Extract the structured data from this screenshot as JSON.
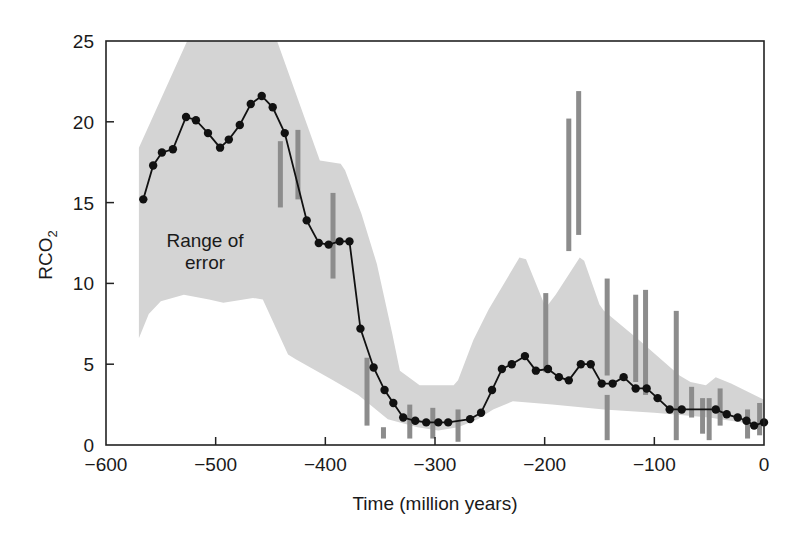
{
  "chart_data": {
    "type": "line",
    "title": "",
    "xlabel": "Time (million years)",
    "ylabel": "RCO2",
    "ylabel_parts": {
      "main": "RCO",
      "sub": "2"
    },
    "xlim": [
      -600,
      0
    ],
    "ylim": [
      0,
      25
    ],
    "x_ticks": [
      -600,
      -500,
      -400,
      -300,
      -200,
      -100,
      0
    ],
    "x_tick_labels": [
      "−600",
      "−500",
      "−400",
      "−300",
      "−200",
      "−100",
      "0"
    ],
    "y_ticks": [
      0,
      5,
      10,
      15,
      20,
      25
    ],
    "y_tick_labels": [
      "0",
      "5",
      "10",
      "15",
      "20",
      "25"
    ],
    "grid": false,
    "legend": null,
    "annotations": [
      {
        "text_lines": [
          "Range of",
          "error"
        ],
        "x": -510,
        "y": 12.8,
        "refers_to": "error_band"
      }
    ],
    "colors": {
      "line": "#111111",
      "marker": "#111111",
      "band": "#d4d4d4",
      "proxy_bars": "#8c8c8c",
      "axis": "#222222"
    },
    "series": [
      {
        "name": "RCO2 model curve",
        "style": "line+markers",
        "x": [
          -566,
          -557,
          -549,
          -539,
          -527,
          -518,
          -507,
          -496,
          -488,
          -478,
          -468,
          -458,
          -448,
          -437,
          -417,
          -406,
          -397,
          -387,
          -378,
          -368,
          -356,
          -346,
          -338,
          -329,
          -318,
          -308,
          -297,
          -288,
          -268,
          -258,
          -248,
          -239,
          -230,
          -218,
          -208,
          -197,
          -187,
          -178,
          -167,
          -158,
          -148,
          -138,
          -128,
          -117,
          -107,
          -97,
          -86,
          -75,
          -44,
          -34,
          -24,
          -16,
          -9,
          0
        ],
        "y": [
          15.2,
          17.3,
          18.1,
          18.3,
          20.3,
          20.1,
          19.3,
          18.4,
          18.9,
          19.8,
          21.1,
          21.6,
          20.9,
          19.3,
          13.9,
          12.5,
          12.4,
          12.6,
          12.6,
          7.2,
          4.8,
          3.4,
          2.6,
          1.7,
          1.5,
          1.4,
          1.4,
          1.4,
          1.6,
          2.0,
          3.4,
          4.7,
          5.0,
          5.5,
          4.6,
          4.7,
          4.2,
          4.0,
          5.0,
          5.0,
          3.8,
          3.8,
          4.2,
          3.5,
          3.5,
          2.9,
          2.2,
          2.2,
          2.2,
          1.9,
          1.7,
          1.5,
          1.2,
          1.4
        ]
      }
    ],
    "error_band": {
      "name": "Range of error",
      "upper": {
        "x": [
          -570,
          -526,
          -525,
          -444,
          -405,
          -386,
          -382,
          -367,
          -353,
          -339,
          -332,
          -314,
          -283,
          -279,
          -265,
          -251,
          -223,
          -217,
          -199,
          -190,
          -168,
          -164,
          -150,
          -146,
          -114,
          -77,
          -67,
          -53,
          -44,
          -30,
          0
        ],
        "y": [
          18.4,
          25,
          25,
          25,
          17.6,
          17.4,
          17.0,
          14.3,
          11.2,
          6.9,
          4.6,
          3.7,
          3.7,
          4.0,
          6.5,
          8.4,
          11.6,
          11.5,
          8.5,
          9.3,
          11.6,
          11.4,
          8.7,
          8.3,
          6.5,
          4.3,
          3.9,
          3.7,
          4.2,
          3.8,
          2.8
        ]
      },
      "lower": {
        "x": [
          -570,
          -561,
          -550,
          -529,
          -506,
          -493,
          -466,
          -457,
          -434,
          -427,
          -393,
          -370,
          -343,
          -316,
          -297,
          -279,
          -261,
          -247,
          -229,
          -193,
          -146,
          -100,
          -50,
          -20,
          0
        ],
        "y": [
          6.6,
          8.1,
          8.9,
          9.3,
          9.0,
          8.8,
          9.1,
          9.0,
          5.6,
          5.3,
          4.0,
          3.1,
          1.6,
          1.1,
          0.9,
          1.1,
          1.6,
          2.2,
          2.7,
          2.5,
          2.2,
          2.0,
          1.7,
          1.4,
          1.2
        ]
      }
    },
    "proxy_error_bars": [
      {
        "x": -441,
        "y_low": 14.7,
        "y_high": 18.8
      },
      {
        "x": -425,
        "y_low": 15.2,
        "y_high": 19.5
      },
      {
        "x": -393,
        "y_low": 10.3,
        "y_high": 15.6
      },
      {
        "x": -362,
        "y_low": 1.2,
        "y_high": 5.4
      },
      {
        "x": -347,
        "y_low": 0.4,
        "y_high": 1.1
      },
      {
        "x": -323,
        "y_low": 0.4,
        "y_high": 2.5
      },
      {
        "x": -302,
        "y_low": 0.4,
        "y_high": 2.3
      },
      {
        "x": -279,
        "y_low": 0.2,
        "y_high": 2.2
      },
      {
        "x": -199,
        "y_low": 4.5,
        "y_high": 9.4
      },
      {
        "x": -178,
        "y_low": 12.0,
        "y_high": 20.2
      },
      {
        "x": -169,
        "y_low": 13.0,
        "y_high": 21.9
      },
      {
        "x": -143,
        "y_low": 4.3,
        "y_high": 10.3
      },
      {
        "x": -143,
        "y_low": 0.3,
        "y_high": 3.1
      },
      {
        "x": -117,
        "y_low": 3.9,
        "y_high": 9.3
      },
      {
        "x": -108,
        "y_low": 3.1,
        "y_high": 9.6
      },
      {
        "x": -80,
        "y_low": 0.3,
        "y_high": 8.3
      },
      {
        "x": -66,
        "y_low": 1.7,
        "y_high": 3.6
      },
      {
        "x": -56,
        "y_low": 0.7,
        "y_high": 2.9
      },
      {
        "x": -50,
        "y_low": 0.3,
        "y_high": 2.9
      },
      {
        "x": -40,
        "y_low": 1.2,
        "y_high": 3.5
      },
      {
        "x": -15,
        "y_low": 0.4,
        "y_high": 2.2
      },
      {
        "x": -4,
        "y_low": 0.6,
        "y_high": 2.6
      }
    ]
  }
}
